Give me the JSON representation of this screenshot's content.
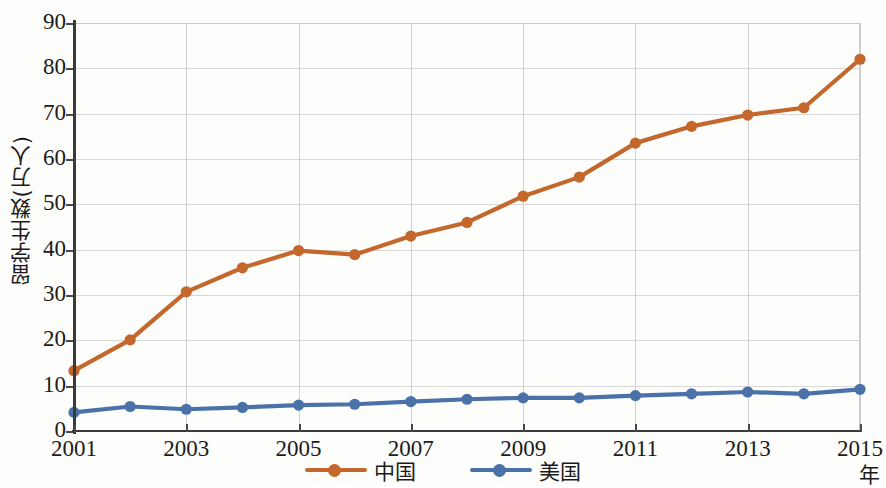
{
  "chart_data": {
    "type": "line",
    "title": "",
    "xlabel": "年",
    "ylabel": "留学生数(万人)",
    "x": [
      2001,
      2002,
      2003,
      2004,
      2005,
      2006,
      2007,
      2008,
      2009,
      2010,
      2011,
      2012,
      2013,
      2014,
      2015
    ],
    "xtick_labels": [
      "2001",
      "2003",
      "2005",
      "2007",
      "2009",
      "2011",
      "2013",
      "2015"
    ],
    "xtick_values": [
      2001,
      2003,
      2005,
      2007,
      2009,
      2011,
      2013,
      2015
    ],
    "ytick_labels": [
      "0",
      "10",
      "20",
      "30",
      "40",
      "50",
      "60",
      "70",
      "80",
      "90"
    ],
    "ytick_values": [
      0,
      10,
      20,
      30,
      40,
      50,
      60,
      70,
      80,
      90
    ],
    "xlim": [
      2001,
      2015
    ],
    "ylim": [
      0,
      90
    ],
    "grid": true,
    "legend_position": "bottom-center",
    "series": [
      {
        "name": "中国",
        "color": "#c4672c",
        "marker": "circle",
        "values": [
          13.3,
          20.1,
          30.7,
          36.0,
          39.8,
          38.9,
          43.0,
          46.0,
          51.8,
          56.0,
          63.5,
          67.2,
          69.7,
          71.3,
          82.0
        ]
      },
      {
        "name": "美国",
        "color": "#4a72a8",
        "marker": "circle",
        "values": [
          4.1,
          5.4,
          4.8,
          5.2,
          5.7,
          5.9,
          6.5,
          7.0,
          7.3,
          7.3,
          7.8,
          8.2,
          8.6,
          8.2,
          9.2
        ]
      }
    ]
  },
  "legend": {
    "items": [
      {
        "label": "中国",
        "color": "#c4672c"
      },
      {
        "label": "美国",
        "color": "#4a72a8"
      }
    ]
  }
}
